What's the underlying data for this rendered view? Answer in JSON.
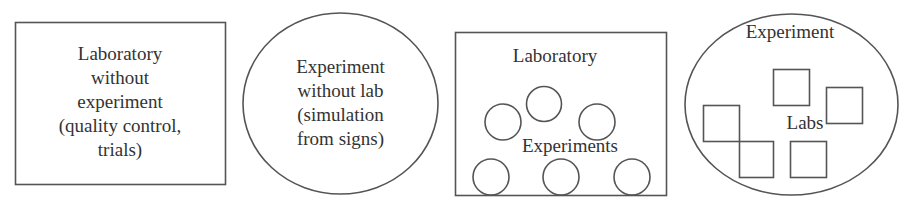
{
  "panels": [
    {
      "id": "lab-without-experiment",
      "shape": "rectangle",
      "lines": [
        "Laboratory",
        "without",
        "experiment",
        "(quality control,",
        "trials)"
      ]
    },
    {
      "id": "experiment-without-lab",
      "shape": "ellipse",
      "lines": [
        "Experiment",
        "without lab",
        "(simulation",
        "from signs)"
      ]
    },
    {
      "id": "lab-contains-experiments",
      "shape": "rectangle",
      "outer_label": "Laboratory",
      "inner_label": "Experiments",
      "inner_shape": "circle",
      "inner_count": 6
    },
    {
      "id": "experiment-contains-labs",
      "shape": "ellipse",
      "outer_label": "Experiment",
      "inner_label": "Labs",
      "inner_shape": "square",
      "inner_count": 5
    }
  ],
  "colors": {
    "stroke": "#555555",
    "text": "#333333",
    "background": "#ffffff"
  }
}
